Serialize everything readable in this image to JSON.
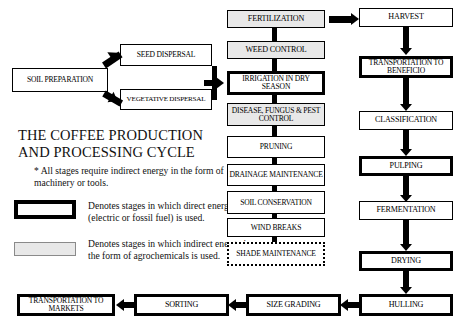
{
  "title": {
    "line1": "THE COFFEE PRODUCTION",
    "line2": "AND PROCESSING CYCLE"
  },
  "footnote": "* All stages require indirect energy in the form of machinery or tools.",
  "legend": {
    "direct": "Denotes stages in which direct energy (electric or fossil fuel) is used.",
    "indirect": "Denotes stages in which indirect energy in the form of agrochemicals is used."
  },
  "colors": {
    "outline": "#000000",
    "agrochemical_fill": "#e8e8e8",
    "background": "#ffffff"
  },
  "nodes": {
    "soil_preparation": "SOIL PREPARATION",
    "seed_dispersal": "SEED DISPERSAL",
    "vegetative_dispersal": "VEGETATIVE DISPERSAL",
    "fertilization": "FERTILIZATION",
    "weed_control": "WEED CONTROL",
    "irrigation": "IRRIGATION IN DRY SEASON",
    "disease_control": "DISEASE, FUNGUS & PEST CONTROL",
    "pruning": "PRUNING",
    "drainage_maintenance": "DRAINAGE MAINTENANCE",
    "soil_conservation": "SOIL CONSERVATION",
    "wind_breaks": "WIND BREAKS",
    "shade_maintenance": "SHADE MAINTENANCE",
    "harvest": "HARVEST",
    "transportation_beneficio": "TRANSPORTATION TO BENEFICIO",
    "classification": "CLASSIFICATION",
    "pulping": "PULPING",
    "fermentation": "FERMENTATION",
    "drying": "DRYING",
    "hulling": "HULLING",
    "size_grading": "SIZE GRADING",
    "sorting": "SORTING",
    "transportation_markets": "TRANSPORTATION TO MARKETS"
  }
}
